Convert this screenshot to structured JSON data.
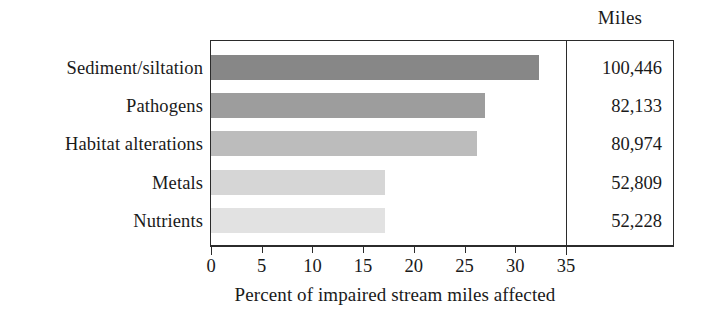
{
  "chart_data": {
    "type": "bar",
    "orientation": "horizontal",
    "title": "",
    "xlabel": "Percent of impaired stream miles affected",
    "ylabel": "",
    "xlim": [
      0,
      35
    ],
    "xticks": [
      0,
      5,
      10,
      15,
      20,
      25,
      30,
      35
    ],
    "xtick_labels": [
      "0",
      "5",
      "10",
      "15",
      "20",
      "25",
      "30",
      "35"
    ],
    "grid": false,
    "legend": null,
    "categories": [
      "Sediment/siltation",
      "Pathogens",
      "Habitat alterations",
      "Metals",
      "Nutrients"
    ],
    "values": [
      32.3,
      27.0,
      26.2,
      17.2,
      17.2
    ],
    "bar_colors": [
      "#878787",
      "#9d9d9d",
      "#bcbcbc",
      "#d6d6d6",
      "#e2e2e2"
    ],
    "side_table": {
      "header": "Miles",
      "values": [
        "100,446",
        "82,133",
        "80,974",
        "52,809",
        "52,228"
      ],
      "numeric_values": [
        100446,
        82133,
        80974,
        52809,
        52228
      ]
    }
  },
  "axis": {
    "x_title": "Percent of impaired stream miles affected",
    "ticks": [
      {
        "value": 0,
        "label": "0"
      },
      {
        "value": 5,
        "label": "5"
      },
      {
        "value": 10,
        "label": "10"
      },
      {
        "value": 15,
        "label": "15"
      },
      {
        "value": 20,
        "label": "20"
      },
      {
        "value": 25,
        "label": "25"
      },
      {
        "value": 30,
        "label": "30"
      },
      {
        "value": 35,
        "label": "35"
      }
    ]
  },
  "table": {
    "header": "Miles",
    "rows": [
      {
        "category": "Sediment/siltation",
        "percent": 32.3,
        "miles": "100,446"
      },
      {
        "category": "Pathogens",
        "percent": 27.0,
        "miles": "82,133"
      },
      {
        "category": "Habitat alterations",
        "percent": 26.2,
        "miles": "80,974"
      },
      {
        "category": "Metals",
        "percent": 17.2,
        "miles": "52,809"
      },
      {
        "category": "Nutrients",
        "percent": 17.2,
        "miles": "52,228"
      }
    ]
  },
  "style": {
    "axis_color": "#2b2b2b",
    "text_color": "#1a1a1a",
    "background": "#ffffff"
  }
}
